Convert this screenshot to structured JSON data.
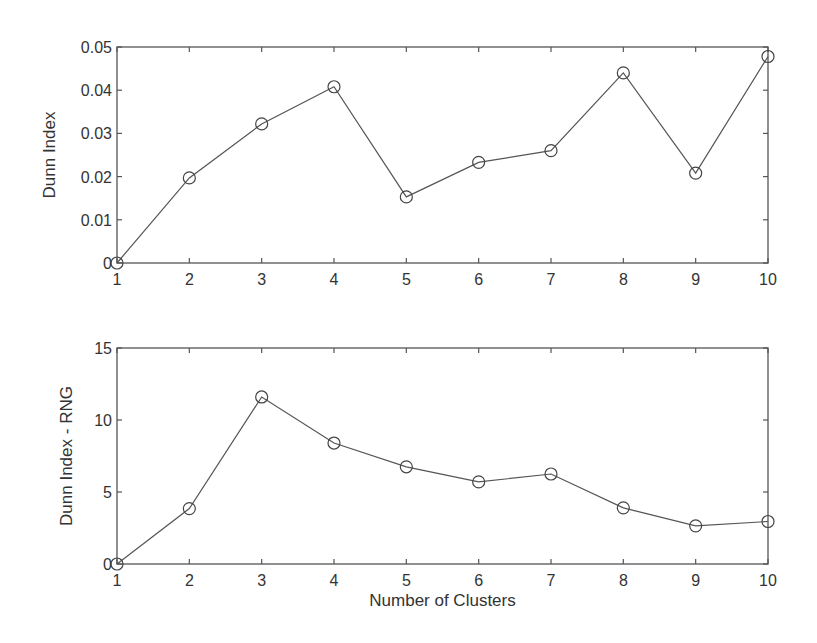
{
  "chart_data": [
    {
      "type": "line",
      "title": "",
      "xlabel": "",
      "ylabel": "Dunn Index",
      "x": [
        1,
        2,
        3,
        4,
        5,
        6,
        7,
        8,
        9,
        10
      ],
      "xlim": [
        1,
        10
      ],
      "ylim": [
        0,
        0.05
      ],
      "xticks": [
        "1",
        "2",
        "3",
        "4",
        "5",
        "6",
        "7",
        "8",
        "9",
        "10"
      ],
      "yticks": [
        0,
        0.01,
        0.02,
        0.03,
        0.04,
        0.05
      ],
      "yticklabels": [
        "0",
        "0.01",
        "0.02",
        "0.03",
        "0.04",
        "0.05"
      ],
      "grid": false,
      "marker": "circle",
      "series": [
        {
          "name": "Dunn Index",
          "values": [
            0,
            0.0197,
            0.0322,
            0.0408,
            0.0153,
            0.0233,
            0.026,
            0.044,
            0.0208,
            0.0478
          ]
        }
      ]
    },
    {
      "type": "line",
      "title": "",
      "xlabel": "Number of Clusters",
      "ylabel": "Dunn Index - RNG",
      "x": [
        1,
        2,
        3,
        4,
        5,
        6,
        7,
        8,
        9,
        10
      ],
      "xlim": [
        1,
        10
      ],
      "ylim": [
        0,
        15
      ],
      "xticks": [
        "1",
        "2",
        "3",
        "4",
        "5",
        "6",
        "7",
        "8",
        "9",
        "10"
      ],
      "yticks": [
        0,
        5,
        10,
        15
      ],
      "yticklabels": [
        "0",
        "5",
        "10",
        "15"
      ],
      "grid": false,
      "marker": "circle",
      "series": [
        {
          "name": "Dunn Index - RNG",
          "values": [
            0,
            3.85,
            11.6,
            8.4,
            6.75,
            5.7,
            6.25,
            3.9,
            2.65,
            2.95
          ]
        }
      ]
    }
  ]
}
